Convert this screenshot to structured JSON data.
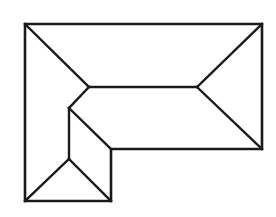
{
  "diagram": {
    "type": "roof-plan",
    "stroke_color": "#1a1a1a",
    "background": "#ffffff",
    "outline_points": [
      [
        25,
        24
      ],
      [
        262,
        24
      ],
      [
        262,
        149
      ],
      [
        111,
        149
      ],
      [
        111,
        201
      ],
      [
        25,
        201
      ]
    ],
    "lines": [
      {
        "name": "hip-top-left",
        "from": [
          25,
          24
        ],
        "to": [
          89,
          87
        ]
      },
      {
        "name": "ridge-main",
        "from": [
          89,
          87
        ],
        "to": [
          197,
          87
        ]
      },
      {
        "name": "hip-top-right",
        "from": [
          197,
          87
        ],
        "to": [
          262,
          24
        ]
      },
      {
        "name": "hip-bottom-right",
        "from": [
          197,
          87
        ],
        "to": [
          262,
          149
        ]
      },
      {
        "name": "valley-upper",
        "from": [
          89,
          87
        ],
        "to": [
          69,
          108
        ]
      },
      {
        "name": "ridge-wing",
        "from": [
          69,
          108
        ],
        "to": [
          69,
          159
        ]
      },
      {
        "name": "valley-inner",
        "from": [
          69,
          108
        ],
        "to": [
          111,
          149
        ]
      },
      {
        "name": "hip-bottom-left",
        "from": [
          69,
          159
        ],
        "to": [
          25,
          201
        ]
      },
      {
        "name": "hip-bottom-inner",
        "from": [
          69,
          159
        ],
        "to": [
          111,
          201
        ]
      }
    ]
  }
}
